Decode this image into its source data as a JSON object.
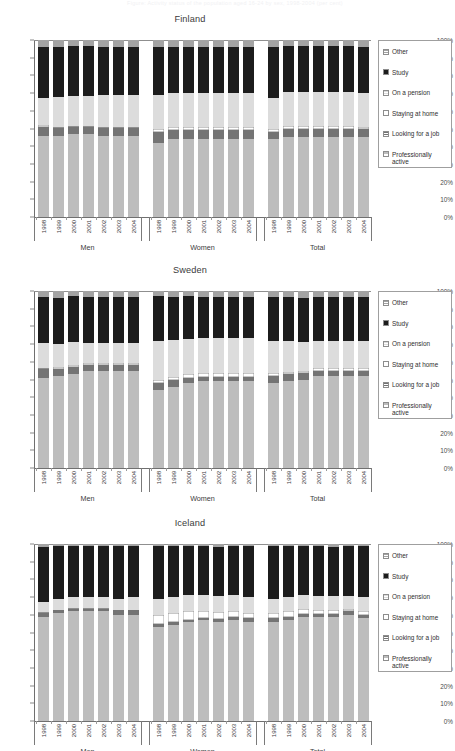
{
  "ghost_title": "Figure: Activity status of the population aged 16-24 by sex, 1998-2004 (per cent)",
  "legend": {
    "items": [
      {
        "label": "Other",
        "key": "other",
        "color": "#a3a3a3",
        "pattern": "hatch"
      },
      {
        "label": "Study",
        "key": "study",
        "color": "#1c1c1c",
        "pattern": "solid"
      },
      {
        "label": "On a pension",
        "key": "pension",
        "color": "#dcdcdc",
        "pattern": "hatch"
      },
      {
        "label": "Staying at home",
        "key": "home",
        "color": "#ffffff",
        "pattern": "solid"
      },
      {
        "label": "Looking for a job",
        "key": "job",
        "color": "#747474",
        "pattern": "hatch"
      },
      {
        "label": "Professionally active",
        "key": "active",
        "color": "#bdbdbd",
        "pattern": "hatch"
      }
    ]
  },
  "axis": {
    "y_ticks": [
      "100%",
      "90%",
      "80%",
      "70%",
      "60%",
      "50%",
      "40%",
      "30%",
      "20%",
      "10%",
      "0%"
    ],
    "y_min": 0,
    "y_max": 100
  },
  "group_labels": [
    "Men",
    "Women",
    "Total"
  ],
  "years": [
    "1998",
    "1999",
    "2000",
    "2001",
    "2002",
    "2003",
    "2004"
  ],
  "chart_data": [
    {
      "type": "bar",
      "title": "Finland",
      "stacked": true,
      "ylabel": "",
      "xlabel": "",
      "ylim": [
        0,
        100
      ],
      "grid": false,
      "legend_position": "right",
      "series_order": [
        "active",
        "job",
        "home",
        "pension",
        "study",
        "other"
      ],
      "groups": [
        {
          "name": "Men",
          "categories": [
            "1998",
            "1999",
            "2000",
            "2001",
            "2002",
            "2003",
            "2004"
          ],
          "series": [
            {
              "name": "Professionally active",
              "values": [
                46,
                46,
                47,
                47,
                46,
                46,
                46
              ]
            },
            {
              "name": "Looking for a job",
              "values": [
                5,
                4.5,
                4,
                4,
                4.5,
                4.5,
                4.5
              ]
            },
            {
              "name": "Staying at home",
              "values": [
                1,
                0.5,
                0.5,
                0.5,
                0.5,
                0.5,
                0.5
              ]
            },
            {
              "name": "On a pension",
              "values": [
                15,
                17,
                17,
                17,
                18,
                18,
                18
              ]
            },
            {
              "name": "Study",
              "values": [
                29,
                28,
                28,
                28,
                27,
                27,
                27
              ]
            },
            {
              "name": "Other",
              "values": [
                4,
                4,
                3.5,
                3.5,
                4,
                4,
                4
              ]
            }
          ]
        },
        {
          "name": "Women",
          "categories": [
            "1998",
            "1999",
            "2000",
            "2001",
            "2002",
            "2003",
            "2004"
          ],
          "series": [
            {
              "name": "Professionally active",
              "values": [
                42,
                44,
                44,
                44,
                44,
                44,
                44
              ]
            },
            {
              "name": "Looking for a job",
              "values": [
                6,
                5,
                5,
                5,
                5,
                5,
                5
              ]
            },
            {
              "name": "Staying at home",
              "values": [
                2,
                2,
                2,
                2,
                2,
                2,
                2
              ]
            },
            {
              "name": "On a pension",
              "values": [
                19,
                19,
                19,
                19,
                19,
                19,
                19
              ]
            },
            {
              "name": "Study",
              "values": [
                27,
                26,
                26,
                26,
                26,
                26,
                26
              ]
            },
            {
              "name": "Other",
              "values": [
                4,
                4,
                4,
                4,
                4,
                4,
                4
              ]
            }
          ]
        },
        {
          "name": "Total",
          "categories": [
            "1998",
            "1999",
            "2000",
            "2001",
            "2002",
            "2003",
            "2004"
          ],
          "series": [
            {
              "name": "Professionally active",
              "values": [
                44,
                45,
                45,
                45,
                45,
                45,
                45
              ]
            },
            {
              "name": "Looking for a job",
              "values": [
                4,
                5,
                5,
                5,
                5,
                5,
                4.5
              ]
            },
            {
              "name": "Staying at home",
              "values": [
                2,
                1.5,
                1.5,
                1.5,
                1.5,
                1.5,
                1.5
              ]
            },
            {
              "name": "On a pension",
              "values": [
                17,
                19,
                19,
                19,
                19,
                19,
                19
              ]
            },
            {
              "name": "Study",
              "values": [
                29,
                26,
                26,
                26,
                26,
                26,
                26
              ]
            },
            {
              "name": "Other",
              "values": [
                4,
                3.5,
                3.5,
                3.5,
                3.5,
                3.5,
                4
              ]
            }
          ]
        }
      ]
    },
    {
      "type": "bar",
      "title": "Sweden",
      "stacked": true,
      "ylabel": "",
      "xlabel": "",
      "ylim": [
        0,
        100
      ],
      "grid": false,
      "legend_position": "right",
      "series_order": [
        "active",
        "job",
        "home",
        "pension",
        "study",
        "other"
      ],
      "groups": [
        {
          "name": "Men",
          "categories": [
            "1998",
            "1999",
            "2000",
            "2001",
            "2002",
            "2003",
            "2004"
          ],
          "series": [
            {
              "name": "Professionally active",
              "values": [
                51,
                52,
                53,
                55,
                55,
                55,
                55
              ]
            },
            {
              "name": "Looking for a job",
              "values": [
                5,
                4,
                4,
                3,
                3,
                3,
                3
              ]
            },
            {
              "name": "Staying at home",
              "values": [
                0.5,
                1,
                1,
                1.5,
                1.5,
                1.5,
                1.5
              ]
            },
            {
              "name": "On a pension",
              "values": [
                14,
                13,
                13,
                11,
                11,
                11,
                11
              ]
            },
            {
              "name": "Study",
              "values": [
                26,
                26,
                26,
                26,
                26,
                26,
                26
              ]
            },
            {
              "name": "Other",
              "values": [
                3.5,
                4,
                3,
                3.5,
                3.5,
                3.5,
                3.5
              ]
            }
          ]
        },
        {
          "name": "Women",
          "categories": [
            "1998",
            "1999",
            "2000",
            "2001",
            "2002",
            "2003",
            "2004"
          ],
          "series": [
            {
              "name": "Professionally active",
              "values": [
                44,
                46,
                48,
                49,
                49,
                49,
                49
              ]
            },
            {
              "name": "Looking for a job",
              "values": [
                4,
                3.5,
                3,
                2.5,
                2.5,
                2.5,
                2.5
              ]
            },
            {
              "name": "Staying at home",
              "values": [
                2,
                2,
                2,
                2,
                2,
                2,
                2
              ]
            },
            {
              "name": "On a pension",
              "values": [
                22,
                21,
                20,
                20,
                20,
                20,
                20
              ]
            },
            {
              "name": "Study",
              "values": [
                25,
                24,
                24,
                23,
                23,
                23,
                23
              ]
            },
            {
              "name": "Other",
              "values": [
                3,
                3.5,
                3,
                3.5,
                3.5,
                3.5,
                3.5
              ]
            }
          ]
        },
        {
          "name": "Total",
          "categories": [
            "1998",
            "1999",
            "2000",
            "2001",
            "2002",
            "2003",
            "2004"
          ],
          "series": [
            {
              "name": "Professionally active",
              "values": [
                48,
                49,
                50,
                52,
                52,
                52,
                52
              ]
            },
            {
              "name": "Looking for a job",
              "values": [
                4,
                4,
                3.5,
                3,
                3,
                3,
                3
              ]
            },
            {
              "name": "Staying at home",
              "values": [
                1.5,
                1.5,
                1.5,
                1.5,
                1.5,
                1.5,
                1.5
              ]
            },
            {
              "name": "On a pension",
              "values": [
                18,
                17,
                16,
                15,
                15,
                15,
                15
              ]
            },
            {
              "name": "Study",
              "values": [
                25,
                25,
                25,
                25,
                25,
                25,
                25
              ]
            },
            {
              "name": "Other",
              "values": [
                3.5,
                3.5,
                4,
                3.5,
                3.5,
                3.5,
                3.5
              ]
            }
          ]
        }
      ]
    },
    {
      "type": "bar",
      "title": "Iceland",
      "stacked": true,
      "ylabel": "",
      "xlabel": "",
      "ylim": [
        0,
        100
      ],
      "grid": false,
      "legend_position": "right",
      "series_order": [
        "active",
        "job",
        "home",
        "pension",
        "study",
        "other"
      ],
      "groups": [
        {
          "name": "Men",
          "categories": [
            "1998",
            "1999",
            "2000",
            "2001",
            "2002",
            "2003",
            "2004"
          ],
          "series": [
            {
              "name": "Professionally active",
              "values": [
                59,
                61,
                62,
                62,
                62,
                60,
                60
              ]
            },
            {
              "name": "Looking for a job",
              "values": [
                2,
                1.5,
                1.5,
                1.5,
                1.5,
                2.5,
                2.5
              ]
            },
            {
              "name": "Staying at home",
              "values": [
                0.5,
                0.5,
                0.5,
                0.5,
                0.5,
                0.5,
                0.5
              ]
            },
            {
              "name": "On a pension",
              "values": [
                6,
                6,
                6,
                6,
                6,
                6,
                7
              ]
            },
            {
              "name": "Study",
              "values": [
                31,
                30,
                29,
                29,
                29,
                30,
                29
              ]
            },
            {
              "name": "Other",
              "values": [
                1.5,
                1,
                1,
                1,
                1,
                1,
                1
              ]
            }
          ]
        },
        {
          "name": "Women",
          "categories": [
            "1998",
            "1999",
            "2000",
            "2001",
            "2002",
            "2003",
            "2004"
          ],
          "series": [
            {
              "name": "Professionally active",
              "values": [
                53,
                54,
                56,
                57,
                56,
                57,
                56
              ]
            },
            {
              "name": "Looking for a job",
              "values": [
                2,
                2,
                1,
                1,
                1.5,
                2,
                2
              ]
            },
            {
              "name": "Staying at home",
              "values": [
                5,
                5,
                5,
                4,
                4,
                3,
                3
              ]
            },
            {
              "name": "On a pension",
              "values": [
                9,
                9,
                9,
                9,
                9,
                9,
                9
              ]
            },
            {
              "name": "Study",
              "values": [
                30,
                29,
                28,
                28,
                28,
                28,
                29
              ]
            },
            {
              "name": "Other",
              "values": [
                1,
                1,
                1,
                1,
                1.5,
                1,
                1
              ]
            }
          ]
        },
        {
          "name": "Total",
          "categories": [
            "1998",
            "1999",
            "2000",
            "2001",
            "2002",
            "2003",
            "2004"
          ],
          "series": [
            {
              "name": "Professionally active",
              "values": [
                56,
                57,
                59,
                59,
                59,
                60,
                58
              ]
            },
            {
              "name": "Looking for a job",
              "values": [
                2,
                2,
                1.5,
                1.5,
                1.5,
                2,
                2
              ]
            },
            {
              "name": "Staying at home",
              "values": [
                3,
                3,
                3,
                2.5,
                2.5,
                1.5,
                2
              ]
            },
            {
              "name": "On a pension",
              "values": [
                8,
                8,
                7.5,
                7.5,
                7.5,
                7,
                8
              ]
            },
            {
              "name": "Study",
              "values": [
                30,
                29,
                28,
                28.5,
                28,
                28.5,
                29
              ]
            },
            {
              "name": "Other",
              "values": [
                1,
                1,
                1,
                1,
                1.5,
                1,
                1
              ]
            }
          ]
        }
      ]
    }
  ]
}
